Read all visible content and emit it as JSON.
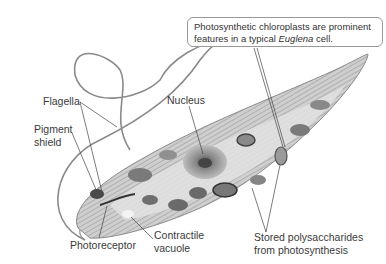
{
  "diagram": {
    "subject": "Euglena cell",
    "style": "grayscale illustration",
    "callout": {
      "line1": "Photosynthetic chloroplasts are prominent",
      "line2_prefix": "features in a typical ",
      "line2_italic": "Euglena",
      "line2_suffix": " cell."
    },
    "labels": {
      "flagella": "Flagella",
      "pigment_shield_1": "Pigment",
      "pigment_shield_2": "shield",
      "nucleus": "Nucleus",
      "photoreceptor": "Photoreceptor",
      "contractile_vacuole_1": "Contractile",
      "contractile_vacuole_2": "vacuole",
      "stored_polysaccharides_1": "Stored polysaccharides",
      "stored_polysaccharides_2": "from photosynthesis"
    },
    "colors": {
      "line": "#444444",
      "cell_fill": "#c8c8c8",
      "cell_stripe": "#9a9a9a",
      "organelle_dark": "#555555",
      "organelle_mid": "#8a8a8a",
      "flagellum": "#888888"
    }
  }
}
